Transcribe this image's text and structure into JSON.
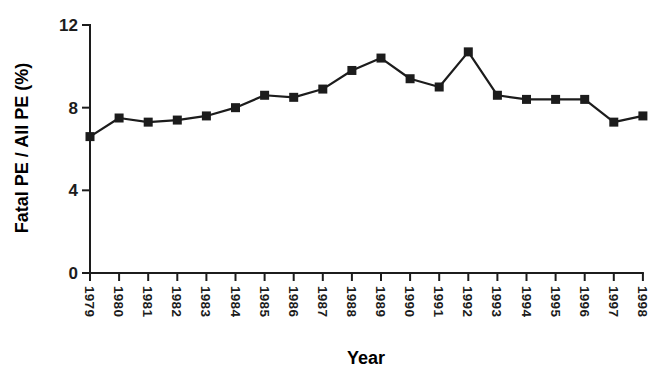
{
  "figure": {
    "background": "#ffffff",
    "ink_color": "#1c1c1c"
  },
  "chart_data": {
    "type": "line",
    "title": "",
    "xlabel": "Year",
    "ylabel": "Fatal PE / All PE (%)",
    "categories": [
      "1979",
      "1980",
      "1981",
      "1982",
      "1983",
      "1984",
      "1985",
      "1986",
      "1987",
      "1988",
      "1989",
      "1990",
      "1991",
      "1992",
      "1993",
      "1994",
      "1995",
      "1996",
      "1997",
      "1998"
    ],
    "series": [
      {
        "name": "Fatal PE / All PE (%)",
        "values": [
          6.6,
          7.5,
          7.3,
          7.4,
          7.6,
          8.0,
          8.6,
          8.5,
          8.9,
          9.8,
          10.4,
          9.4,
          9.0,
          10.7,
          8.6,
          8.4,
          8.4,
          8.4,
          7.3,
          7.6
        ]
      }
    ],
    "ylim": [
      0,
      12
    ],
    "yticks": [
      0,
      4,
      8,
      12
    ],
    "grid": false,
    "legend": "none",
    "marker": "filled-square",
    "line_color": "#1c1c1c",
    "x_tick_rotation_deg": 90
  }
}
